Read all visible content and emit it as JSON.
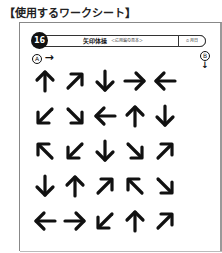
{
  "heading": "【使用するワークシート】",
  "worksheet": {
    "number": "16",
    "title": "矢印体操",
    "subtitle": "＜応用編の見本＞",
    "time_label": "⏱ 月日",
    "start_marker": "A",
    "start_arrow": "→",
    "end_marker": "B",
    "end_arrow": "↓",
    "arrow_grid": [
      [
        "up",
        "up-right",
        "down",
        "right",
        "left"
      ],
      [
        "down-left",
        "down-right",
        "left",
        "up",
        "down"
      ],
      [
        "up-left",
        "down-left",
        "down",
        "down-right",
        "up-right"
      ],
      [
        "down",
        "up",
        "up-right",
        "up-left",
        "down-right"
      ],
      [
        "left",
        "right",
        "down-left",
        "up",
        "up-right"
      ]
    ]
  }
}
